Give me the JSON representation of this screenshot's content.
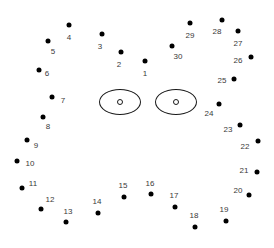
{
  "puzzle": {
    "title": "Connect the Dots",
    "type": "dot-to-dot",
    "width": 274,
    "height": 248,
    "background_color": "#ffffff",
    "dot_color": "#000000",
    "label_color": "#3a3a3a",
    "outline_color": "#1a1a1a",
    "dot_count": 30,
    "dots": [
      {
        "label": "1",
        "x": 145,
        "y": 61,
        "lx": 145,
        "ly": 74
      },
      {
        "label": "2",
        "x": 121,
        "y": 52,
        "lx": 119,
        "ly": 65
      },
      {
        "label": "3",
        "x": 102,
        "y": 34,
        "lx": 100,
        "ly": 47
      },
      {
        "label": "4",
        "x": 69,
        "y": 25,
        "lx": 69,
        "ly": 38
      },
      {
        "label": "5",
        "x": 48,
        "y": 41,
        "lx": 53,
        "ly": 52
      },
      {
        "label": "6",
        "x": 39,
        "y": 70,
        "lx": 47,
        "ly": 74
      },
      {
        "label": "7",
        "x": 52,
        "y": 97,
        "lx": 63,
        "ly": 101
      },
      {
        "label": "8",
        "x": 43,
        "y": 117,
        "lx": 48,
        "ly": 127
      },
      {
        "label": "9",
        "x": 27,
        "y": 140,
        "lx": 36,
        "ly": 146
      },
      {
        "label": "10",
        "x": 17,
        "y": 161,
        "lx": 30,
        "ly": 164
      },
      {
        "label": "11",
        "x": 22,
        "y": 188,
        "lx": 33,
        "ly": 184
      },
      {
        "label": "12",
        "x": 41,
        "y": 209,
        "lx": 50,
        "ly": 200
      },
      {
        "label": "13",
        "x": 66,
        "y": 222,
        "lx": 68,
        "ly": 212
      },
      {
        "label": "14",
        "x": 98,
        "y": 213,
        "lx": 97,
        "ly": 202
      },
      {
        "label": "15",
        "x": 124,
        "y": 197,
        "lx": 123,
        "ly": 186
      },
      {
        "label": "16",
        "x": 151,
        "y": 194,
        "lx": 150,
        "ly": 184
      },
      {
        "label": "17",
        "x": 175,
        "y": 207,
        "lx": 174,
        "ly": 196
      },
      {
        "label": "18",
        "x": 195,
        "y": 227,
        "lx": 194,
        "ly": 216
      },
      {
        "label": "19",
        "x": 226,
        "y": 221,
        "lx": 224,
        "ly": 210
      },
      {
        "label": "20",
        "x": 249,
        "y": 195,
        "lx": 238,
        "ly": 191
      },
      {
        "label": "21",
        "x": 257,
        "y": 172,
        "lx": 244,
        "ly": 171
      },
      {
        "label": "22",
        "x": 258,
        "y": 141,
        "lx": 245,
        "ly": 147
      },
      {
        "label": "23",
        "x": 240,
        "y": 125,
        "lx": 228,
        "ly": 130
      },
      {
        "label": "24",
        "x": 219,
        "y": 104,
        "lx": 209,
        "ly": 114
      },
      {
        "label": "25",
        "x": 234,
        "y": 79,
        "lx": 222,
        "ly": 81
      },
      {
        "label": "26",
        "x": 251,
        "y": 57,
        "lx": 238,
        "ly": 61
      },
      {
        "label": "27",
        "x": 238,
        "y": 31,
        "lx": 238,
        "ly": 44
      },
      {
        "label": "28",
        "x": 222,
        "y": 20,
        "lx": 217,
        "ly": 32
      },
      {
        "label": "29",
        "x": 190,
        "y": 23,
        "lx": 190,
        "ly": 36
      },
      {
        "label": "30",
        "x": 172,
        "y": 46,
        "lx": 178,
        "ly": 57
      }
    ],
    "eyes": [
      {
        "name": "left-eye",
        "cx": 120,
        "cy": 102,
        "rx": 21,
        "ry": 13,
        "pupil_cx": 120,
        "pupil_cy": 102
      },
      {
        "name": "right-eye",
        "cx": 176,
        "cy": 102,
        "rx": 21,
        "ry": 13,
        "pupil_cx": 176,
        "pupil_cy": 102
      }
    ]
  }
}
